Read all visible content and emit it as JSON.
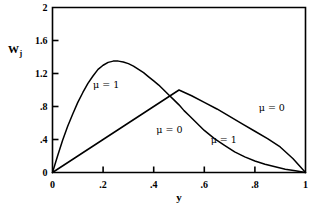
{
  "chart_data": {
    "type": "line",
    "title": "",
    "xlabel": "y",
    "ylabel": "W_j",
    "ylabel_base": "W",
    "ylabel_sub": "j",
    "xlim": [
      0,
      1
    ],
    "ylim": [
      0,
      2
    ],
    "grid": false,
    "legend_position": "inline-annotations",
    "x_ticks": [
      0,
      0.2,
      0.4,
      0.6,
      0.8,
      1
    ],
    "x_tick_labels": [
      "0",
      ".2",
      ".4",
      ".6",
      ".8",
      "1"
    ],
    "y_ticks": [
      0,
      0.4,
      0.8,
      1.2,
      1.6,
      2
    ],
    "y_tick_labels": [
      "0",
      ".4",
      ".8",
      "1.2",
      "1.6",
      "2"
    ],
    "series": [
      {
        "name": "mu = 1",
        "label": "μ = 1",
        "x": [
          0,
          0.02,
          0.04,
          0.06,
          0.08,
          0.1,
          0.12,
          0.14,
          0.16,
          0.18,
          0.2,
          0.22,
          0.24,
          0.26,
          0.28,
          0.3,
          0.32,
          0.34,
          0.36,
          0.38,
          0.4,
          0.42,
          0.44,
          0.46,
          0.48,
          0.5,
          0.52,
          0.54,
          0.56,
          0.58,
          0.6,
          0.64,
          0.68,
          0.72,
          0.76,
          0.8,
          0.84,
          0.88,
          0.92,
          0.96,
          1
        ],
        "y": [
          0,
          0.2,
          0.39,
          0.56,
          0.71,
          0.85,
          0.97,
          1.08,
          1.17,
          1.25,
          1.3,
          1.335,
          1.35,
          1.35,
          1.34,
          1.32,
          1.29,
          1.25,
          1.21,
          1.16,
          1.11,
          1.06,
          1.0,
          0.94,
          0.88,
          0.82,
          0.75,
          0.69,
          0.63,
          0.57,
          0.51,
          0.41,
          0.33,
          0.25,
          0.19,
          0.14,
          0.1,
          0.07,
          0.04,
          0.02,
          0
        ]
      },
      {
        "name": "mu = 0",
        "label": "μ = 0",
        "x": [
          0,
          0.1,
          0.2,
          0.3,
          0.4,
          0.5,
          0.55,
          0.6,
          0.65,
          0.7,
          0.75,
          0.8,
          0.85,
          0.9,
          0.95,
          1
        ],
        "y": [
          0,
          0.2,
          0.4,
          0.6,
          0.8,
          1.0,
          0.93,
          0.85,
          0.77,
          0.68,
          0.59,
          0.5,
          0.41,
          0.31,
          0.17,
          0
        ]
      }
    ],
    "annotations": [
      {
        "text": "μ = 1",
        "x": 0.16,
        "y": 1.06,
        "name": "annotation-mu-1-left"
      },
      {
        "text": "μ = 0",
        "x": 0.41,
        "y": 0.52,
        "name": "annotation-mu-0-middle"
      },
      {
        "text": "μ = 0",
        "x": 0.815,
        "y": 0.78,
        "name": "annotation-mu-0-right"
      },
      {
        "text": "μ = 1",
        "x": 0.625,
        "y": 0.4,
        "name": "annotation-mu-1-right"
      }
    ],
    "colors": {
      "curve": "#000000",
      "axis": "#000000",
      "background": "#ffffff"
    },
    "crossing_point": {
      "x": 0.5,
      "y": 1.0
    },
    "peak_mu1": {
      "x": 0.25,
      "y": 1.35
    }
  }
}
